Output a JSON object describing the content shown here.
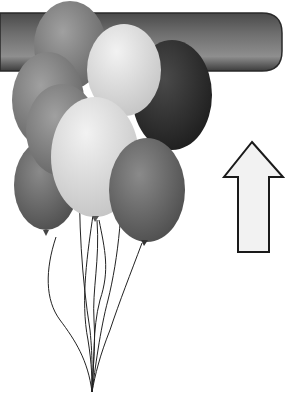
{
  "illustration": {
    "subject": "balloons-rising-under-bar",
    "bar": {
      "color": "#6a6a6a",
      "highlight": "#9a9a9a",
      "shadow": "#3a3a3a"
    },
    "balloons": [
      {
        "id": "back-top",
        "fill": "#7a7a7a"
      },
      {
        "id": "dark-right",
        "fill": "#2e2e2e"
      },
      {
        "id": "left-mid",
        "fill": "#8c8c8c"
      },
      {
        "id": "left-low",
        "fill": "#6c6c6c"
      },
      {
        "id": "white-top",
        "fill": "#d6d6d6"
      },
      {
        "id": "white-mid",
        "fill": "#dcdcdc"
      },
      {
        "id": "right-low",
        "fill": "#5e5e5e"
      }
    ],
    "arrow": {
      "direction": "up",
      "fill": "#f2f2f2",
      "stroke": "#1a1a1a"
    }
  }
}
